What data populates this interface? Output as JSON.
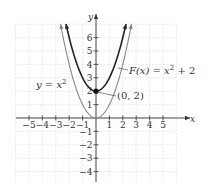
{
  "chart_data": {
    "type": "line",
    "title": "",
    "xlabel": "x",
    "ylabel": "y",
    "xlim": [
      -5.8,
      6
    ],
    "ylim": [
      -4.8,
      7
    ],
    "grid": true,
    "x_ticks": [
      -5,
      -4,
      -3,
      -2,
      -1,
      1,
      2,
      3,
      4,
      5
    ],
    "y_ticks": [
      -4,
      -3,
      -2,
      -1,
      1,
      2,
      3,
      4,
      5,
      6
    ],
    "x_tick_labels": [
      "−5",
      "−4",
      "−3",
      "−2",
      "−1",
      "1",
      "2",
      "3",
      "4",
      "5"
    ],
    "y_tick_labels": [
      "−4",
      "−3",
      "−2",
      "−1",
      "1",
      "2",
      "3",
      "4",
      "5",
      "6"
    ],
    "series": [
      {
        "name": "y = x²",
        "formula": "x^2",
        "color": "#888888",
        "x": [
          -2.65,
          -2,
          -1,
          0,
          1,
          2,
          2.65
        ],
        "y": [
          7.02,
          4,
          1,
          0,
          1,
          4,
          7.02
        ]
      },
      {
        "name": "F(x) = x² + 2",
        "formula": "x^2 + 2",
        "color": "#222222",
        "x": [
          -2.24,
          -2,
          -1,
          0,
          1,
          2,
          2.24
        ],
        "y": [
          7.02,
          6,
          3,
          2,
          3,
          6,
          7.02
        ]
      }
    ],
    "annotations": [
      {
        "text": "y = x²",
        "target": "y = x²"
      },
      {
        "text": "F(x) = x² + 2",
        "target": "F(x) = x² + 2"
      },
      {
        "text": "(0, 2)",
        "point": [
          0,
          2
        ]
      }
    ],
    "highlighted_point": [
      0,
      2
    ]
  },
  "labels": {
    "x_axis": "x",
    "y_axis": "y",
    "curve1": "y = x",
    "curve1_exp": "2",
    "curve2_pre": "F(x) = x",
    "curve2_exp": "2",
    "curve2_post": " + 2",
    "point": "(0, 2)"
  }
}
